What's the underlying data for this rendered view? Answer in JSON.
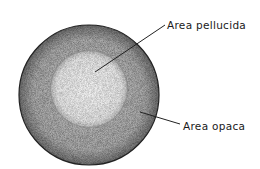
{
  "diagram": {
    "labels": {
      "pellucida": "Area pellucida",
      "opaca": "Area opaca"
    },
    "colors": {
      "outer_ring": "#9a9a9a",
      "inner_disc": "#e6e6e6",
      "outline": "#222222",
      "leader": "#222222"
    }
  }
}
